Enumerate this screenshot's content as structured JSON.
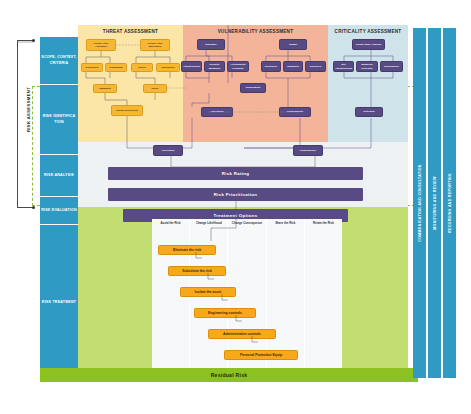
{
  "diagram": {
    "risk_assessment_label": "RISK ASSESSMENT",
    "residual_risk_label": "Residual Risk"
  },
  "phases": [
    {
      "label": "SCOPE, CONTEXT, CRITERIA"
    },
    {
      "label": "RISK IDENTIFICA TION"
    },
    {
      "label": "RISK ANALYSIS"
    },
    {
      "label": "RISK EVALUATION"
    },
    {
      "label": "RISK TREATMENT"
    }
  ],
  "columns": {
    "threat": {
      "title": "THREAT ASSESSMENT",
      "nodes": [
        {
          "label": "Threat Actor Attributes"
        },
        {
          "label": "Threat Actor Motivation"
        },
        {
          "label": "Resources"
        },
        {
          "label": "Knowledge"
        },
        {
          "label": "Desire"
        },
        {
          "label": "Confidence"
        },
        {
          "label": "Capability"
        },
        {
          "label": "Intent"
        },
        {
          "label": "Threat (prioritised)"
        }
      ]
    },
    "vulnerability": {
      "title": "VULNERABILITY ASSESSMENT",
      "nodes": [
        {
          "label": "Exposure"
        },
        {
          "label": "Attractiveness"
        },
        {
          "label": "Security Measures"
        },
        {
          "label": "Accessibility Proximity"
        },
        {
          "label": "Impact"
        },
        {
          "label": "Resilience"
        },
        {
          "label": "Capability"
        },
        {
          "label": "Recovery"
        },
        {
          "label": "Vulnerability"
        },
        {
          "label": "Likelihood"
        },
        {
          "label": "Consequence"
        }
      ]
    },
    "criticality": {
      "title": "CRITICALITY ASSESSMENT",
      "nodes": [
        {
          "label": "Threat Value Analysis"
        },
        {
          "label": "Site Attractiveness"
        },
        {
          "label": "Business Criticality"
        },
        {
          "label": "Dependency"
        },
        {
          "label": "Criticality"
        }
      ]
    }
  },
  "analysis_nodes": [
    {
      "label": "Likelihood"
    },
    {
      "label": "Consequence"
    }
  ],
  "bars": [
    {
      "label": "Risk Rating"
    },
    {
      "label": "Risk Prioritisation"
    },
    {
      "label": "Treatment Options"
    }
  ],
  "treatment": {
    "column_headers": [
      "Avoid the Risk",
      "Change Likelihood",
      "Change Consequence",
      "Share the Risk",
      "Retain the Risk"
    ],
    "steps": [
      "Eliminate the risk",
      "Substitute the risk",
      "Isolate the asset",
      "Engineering controls",
      "Administrative controls",
      "Personal Protective Equip"
    ]
  },
  "side_bars": [
    {
      "label": "COMMUNICATION AND CONSULTATION"
    },
    {
      "label": "MONITORING AND REVIEW"
    },
    {
      "label": "RECORDING AND REPORTING"
    }
  ],
  "colors": {
    "teal": "#2f9bc4",
    "yellow_panel": "#fbe6a8",
    "peach_panel": "#f3b49a",
    "blue_panel": "#cfe4ea",
    "grey_panel": "#eef1f4",
    "green_panel": "#c3de70",
    "purple_node": "#584b84",
    "orange_node": "#f7a81b",
    "residual_green": "#8cc122"
  }
}
